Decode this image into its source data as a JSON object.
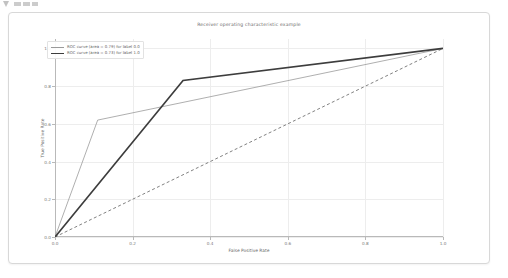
{
  "artifact": {
    "name": "page-edge-artifact"
  },
  "figure": {
    "title": "Receiver operating characteristic example"
  },
  "chart_data": {
    "type": "line",
    "title": "Receiver operating characteristic example",
    "xlabel": "False Positive Rate",
    "ylabel": "True Positive Rate",
    "xlim": [
      0.0,
      1.0
    ],
    "ylim": [
      0.0,
      1.05
    ],
    "grid": true,
    "legend_position": "upper left",
    "xticks": [
      "0.0",
      "0.2",
      "0.4",
      "0.6",
      "0.8",
      "1.0"
    ],
    "xtickvalues": [
      0.0,
      0.2,
      0.4,
      0.6,
      0.8,
      1.0
    ],
    "yticks": [
      "0.0",
      "0.2",
      "0.4",
      "0.6",
      "0.8",
      "1.0"
    ],
    "ytickvalues": [
      0.0,
      0.2,
      0.4,
      0.6,
      0.8,
      1.0
    ],
    "series": [
      {
        "name": "roc-curve-label-0",
        "legend": "ROC curve (area = 0.79) for label 0.0",
        "color": "#9a9a9a",
        "width": 0.8,
        "dash": "solid",
        "auc": 0.79,
        "x": [
          0.0,
          0.11,
          1.0
        ],
        "y": [
          0.0,
          0.62,
          1.0
        ]
      },
      {
        "name": "roc-curve-label-1",
        "legend": "ROC curve (area = 0.73) for label 1.0",
        "color": "#3d3d3d",
        "width": 1.7,
        "dash": "solid",
        "auc": 0.73,
        "x": [
          0.0,
          0.33,
          1.0
        ],
        "y": [
          0.0,
          0.83,
          1.0
        ]
      },
      {
        "name": "chance-line",
        "legend": "",
        "color": "#4a4a4a",
        "width": 0.7,
        "dash": "dashed",
        "x": [
          0.0,
          1.0
        ],
        "y": [
          0.0,
          1.0
        ]
      }
    ],
    "legend_entries": [
      {
        "label": "ROC curve (area = 0.79) for label 0.0",
        "color": "#9a9a9a",
        "width": 0.8
      },
      {
        "label": "ROC curve (area = 0.73) for label 1.0",
        "color": "#3d3d3d",
        "width": 1.7
      }
    ]
  }
}
